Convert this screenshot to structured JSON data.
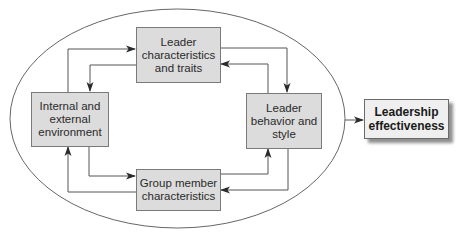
{
  "diagram": {
    "type": "leadership-model",
    "boundary": {
      "shape": "ellipse",
      "stroke": "#555555"
    },
    "nodes": [
      {
        "id": "traits",
        "label": "Leader\ncharacteristics\nand traits",
        "fill": "#dcdcdc"
      },
      {
        "id": "environment",
        "label": "Internal and\nexternal\nenvironment",
        "fill": "#dcdcdc"
      },
      {
        "id": "behavior",
        "label": "Leader\nbehavior and\nstyle",
        "fill": "#dcdcdc"
      },
      {
        "id": "group",
        "label": "Group member\ncharacteristics",
        "fill": "#dcdcdc"
      },
      {
        "id": "effectiveness",
        "label": "Leadership\neffectiveness",
        "fill": "#efefef"
      }
    ],
    "edges": [
      {
        "from": "environment",
        "to": "traits"
      },
      {
        "from": "traits",
        "to": "environment"
      },
      {
        "from": "traits",
        "to": "behavior"
      },
      {
        "from": "behavior",
        "to": "traits"
      },
      {
        "from": "environment",
        "to": "group"
      },
      {
        "from": "group",
        "to": "environment"
      },
      {
        "from": "group",
        "to": "behavior"
      },
      {
        "from": "behavior",
        "to": "group"
      },
      {
        "from": "ellipse",
        "to": "effectiveness"
      }
    ]
  }
}
